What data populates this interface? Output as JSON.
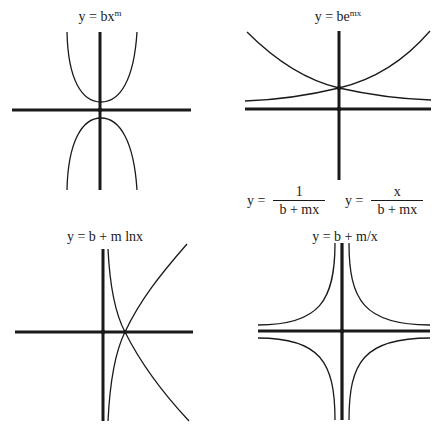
{
  "panels": [
    {
      "id": "power",
      "title_prefix": "y = bx",
      "title_sup": "m",
      "curve_description": [
        "upward parabola above origin",
        "downward parabola below origin"
      ]
    },
    {
      "id": "exponential",
      "title_prefix": "y = be",
      "title_sup": "mx",
      "curve_description": [
        "decreasing exponential",
        "increasing exponential",
        "both intersect on y-axis above origin"
      ],
      "caption": {
        "left": {
          "lhs": "y =",
          "numerator": "1",
          "denominator": "b + mx"
        },
        "right": {
          "lhs": "y =",
          "numerator": "x",
          "denominator": "b + mx"
        }
      }
    },
    {
      "id": "logarithmic",
      "title": "y = b + m lnx",
      "curve_description": [
        "increasing log curve",
        "decreasing log curve",
        "both cross x-axis at same point right of origin"
      ]
    },
    {
      "id": "reciprocal",
      "title": "y = b + m/x",
      "curve_description": [
        "hyperbola branches in all four quadrants approaching both axes"
      ]
    }
  ],
  "colors": {
    "background": "#ffffff",
    "ink": "#1a1a1a"
  }
}
